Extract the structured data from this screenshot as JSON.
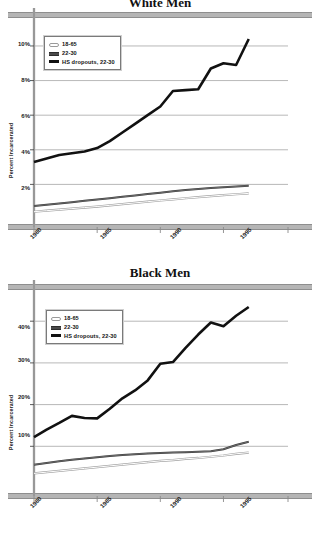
{
  "charts": [
    {
      "title": "White Men",
      "ylabel": "Percent Incarcerated",
      "yticks": [
        "2%",
        "4%",
        "6%",
        "8%",
        "10%"
      ],
      "xticks": [
        "1980",
        "1985",
        "1990",
        "1995"
      ],
      "legend": [
        {
          "label": "18-65",
          "style": "thin"
        },
        {
          "label": "22-30",
          "style": "mid"
        },
        {
          "label": "HS dropouts, 22-30",
          "style": "thick"
        }
      ]
    },
    {
      "title": "Black Men",
      "ylabel": "Percent Incarcerated",
      "yticks": [
        "10%",
        "20%",
        "30%",
        "40%"
      ],
      "xticks": [
        "1980",
        "1985",
        "1990",
        "1995"
      ],
      "legend": [
        {
          "label": "18-65",
          "style": "thin"
        },
        {
          "label": "22-30",
          "style": "mid"
        },
        {
          "label": "HS dropouts, 22-30",
          "style": "thick"
        }
      ]
    }
  ],
  "chart_data": [
    {
      "type": "line",
      "title": "White Men",
      "xlabel": "",
      "ylabel": "Percent Incarcerated",
      "xlim": [
        1980,
        1999
      ],
      "ylim": [
        0,
        11.5
      ],
      "yticks": [
        2,
        4,
        6,
        8,
        10
      ],
      "ytick_labels": [
        "2%",
        "4%",
        "6%",
        "8%",
        "10%"
      ],
      "xticks": [
        1980,
        1985,
        1990,
        1995
      ],
      "xtick_labels": [
        "1980",
        "1985",
        "1990",
        "1995"
      ],
      "grid": true,
      "legend_position": "upper-left",
      "x": [
        1980,
        1981,
        1982,
        1983,
        1984,
        1985,
        1986,
        1987,
        1988,
        1989,
        1990,
        1991,
        1992,
        1993,
        1994,
        1995,
        1996,
        1997
      ],
      "series": [
        {
          "name": "HS dropouts, 22-30",
          "values": [
            3.3,
            3.5,
            3.7,
            3.8,
            3.9,
            4.1,
            4.5,
            5.0,
            5.5,
            6.0,
            6.5,
            7.4,
            7.45,
            7.5,
            8.7,
            9.0,
            8.9,
            10.4
          ]
        },
        {
          "name": "22-30",
          "values": [
            0.75,
            0.82,
            0.9,
            0.97,
            1.05,
            1.12,
            1.2,
            1.28,
            1.36,
            1.44,
            1.52,
            1.6,
            1.67,
            1.73,
            1.79,
            1.84,
            1.88,
            1.92
          ]
        },
        {
          "name": "18-65",
          "values": [
            0.42,
            0.48,
            0.54,
            0.6,
            0.66,
            0.72,
            0.79,
            0.86,
            0.93,
            1.0,
            1.07,
            1.13,
            1.2,
            1.26,
            1.32,
            1.38,
            1.43,
            1.48
          ]
        }
      ]
    },
    {
      "type": "line",
      "title": "Black Men",
      "xlabel": "",
      "ylabel": "Percent Incarcerated",
      "xlim": [
        1980,
        1999
      ],
      "ylim": [
        0,
        47
      ],
      "yticks": [
        10,
        20,
        30,
        40
      ],
      "ytick_labels": [
        "10%",
        "20%",
        "30%",
        "40%"
      ],
      "xticks": [
        1980,
        1985,
        1990,
        1995
      ],
      "xtick_labels": [
        "1980",
        "1985",
        "1990",
        "1995"
      ],
      "grid": true,
      "legend_position": "upper-left",
      "x": [
        1980,
        1981,
        1982,
        1983,
        1984,
        1985,
        1986,
        1987,
        1988,
        1989,
        1990,
        1991,
        1992,
        1993,
        1994,
        1995,
        1996,
        1997
      ],
      "series": [
        {
          "name": "HS dropouts, 22-30",
          "values": [
            12.2,
            14.0,
            15.6,
            17.3,
            16.8,
            16.7,
            19.0,
            21.5,
            23.4,
            25.8,
            29.8,
            30.2,
            33.6,
            36.8,
            39.7,
            38.8,
            41.3,
            43.4
          ]
        },
        {
          "name": "22-30",
          "values": [
            5.6,
            6.0,
            6.4,
            6.8,
            7.1,
            7.4,
            7.7,
            7.9,
            8.1,
            8.3,
            8.4,
            8.5,
            8.6,
            8.7,
            8.8,
            9.3,
            10.3,
            11.1
          ]
        },
        {
          "name": "18-65",
          "values": [
            3.5,
            3.8,
            4.1,
            4.4,
            4.7,
            5.0,
            5.3,
            5.6,
            5.9,
            6.2,
            6.5,
            6.7,
            7.0,
            7.2,
            7.5,
            7.8,
            8.2,
            8.5
          ]
        }
      ]
    }
  ]
}
